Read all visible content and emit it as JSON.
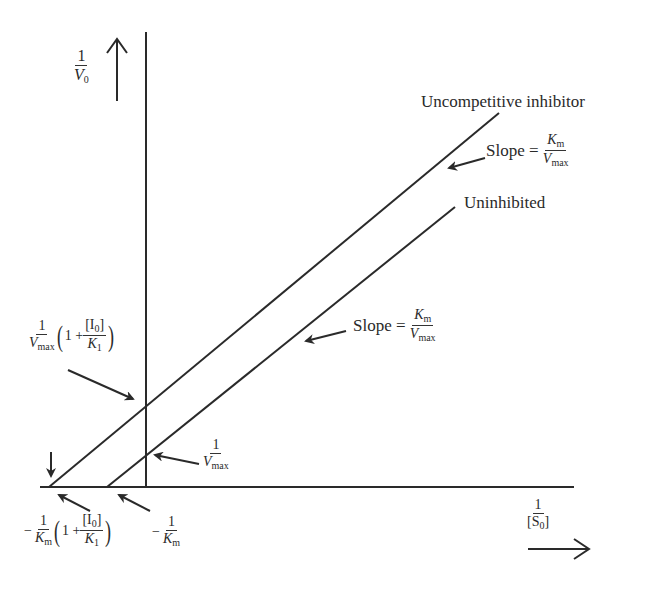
{
  "diagram": {
    "y_axis_label": {
      "num": "1",
      "den_var": "V",
      "den_sub": "0"
    },
    "x_axis_label": {
      "num": "1",
      "den": "[S",
      "den_sub": "0",
      "den_close": "]"
    },
    "lines": [
      {
        "name": "Uncompetitive inhibitor",
        "label": "Uncompetitive inhibitor"
      },
      {
        "name": "Uninhibited",
        "label": "Uninhibited"
      }
    ],
    "slope_upper": {
      "prefix": "Slope =",
      "num_var": "K",
      "num_sub": "m",
      "den_var": "V",
      "den_sub": "max"
    },
    "slope_lower": {
      "prefix": "Slope =",
      "num_var": "K",
      "num_sub": "m",
      "den_var": "V",
      "den_sub": "max"
    },
    "y_intercept_inhibited": {
      "num": "1",
      "den_var": "V",
      "den_sub": "max",
      "open": "(",
      "one_plus": "1 +",
      "i_num": "[I",
      "i_sub": "0",
      "i_close": "]",
      "k_var": "K",
      "k_sub": "1",
      "close": ")"
    },
    "y_intercept_uninhibited": {
      "num": "1",
      "den_var": "V",
      "den_sub": "max"
    },
    "x_intercept_inhibited": {
      "sign": "−",
      "num": "1",
      "den_var": "K",
      "den_sub": "m",
      "open": "(",
      "one_plus": "1 +",
      "i_num": "[I",
      "i_sub": "0",
      "i_close": "]",
      "k_var": "K",
      "k_sub": "1",
      "close": ")"
    },
    "x_intercept_uninhibited": {
      "sign": "−",
      "num": "1",
      "den_var": "K",
      "den_sub": "m"
    },
    "colors": {
      "ink": "#2a2a2a",
      "background": "#ffffff"
    }
  }
}
